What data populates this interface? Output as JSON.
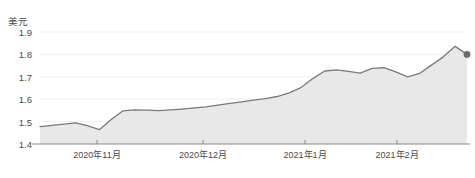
{
  "chart_data": {
    "type": "line",
    "title": "",
    "subtitle": "",
    "xlabel": "",
    "ylabel": "美元",
    "unit_label": "美元",
    "ylim": [
      1.4,
      1.9
    ],
    "y_ticks": [
      "1.4",
      "1.5",
      "1.6",
      "1.7",
      "1.8",
      "1.9"
    ],
    "y_tick_values": [
      1.4,
      1.5,
      1.6,
      1.7,
      1.8,
      1.9
    ],
    "x_tick_labels": [
      "2020年11月",
      "2020年12月",
      "2021年1月",
      "2021年2月"
    ],
    "x_tick_positions": [
      97,
      203,
      305,
      397
    ],
    "grid": true,
    "legend": null,
    "line_color": "#7a7a7a",
    "fill_color": "#e8e8e8",
    "marker": {
      "shown": true,
      "position": "last-point",
      "color": "#6b6b6b",
      "value": 1.8
    },
    "series": [
      {
        "name": "美元",
        "values": [
          1.478,
          1.483,
          1.489,
          1.494,
          1.482,
          1.464,
          1.509,
          1.548,
          1.552,
          1.551,
          1.549,
          1.552,
          1.556,
          1.561,
          1.566,
          1.574,
          1.581,
          1.588,
          1.596,
          1.603,
          1.612,
          1.628,
          1.652,
          1.692,
          1.726,
          1.731,
          1.724,
          1.716,
          1.738,
          1.741,
          1.722,
          1.7,
          1.715,
          1.752,
          1.789,
          1.836,
          1.8
        ]
      }
    ],
    "x_index": [
      0,
      1,
      2,
      3,
      4,
      5,
      6,
      7,
      8,
      9,
      10,
      11,
      12,
      13,
      14,
      15,
      16,
      17,
      18,
      19,
      20,
      21,
      22,
      23,
      24,
      25,
      26,
      27,
      28,
      29,
      30,
      31,
      32,
      33,
      34,
      35,
      36
    ]
  },
  "plot_geometry": {
    "left": 40,
    "right": 467,
    "top": 32,
    "bottom": 144
  }
}
